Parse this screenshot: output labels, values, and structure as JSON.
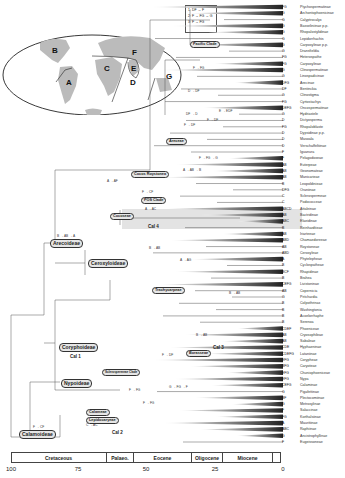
{
  "figure": {
    "legend": {
      "items": [
        "1: DF → F",
        "2: F → FG → G",
        "3: F → FG"
      ]
    },
    "map": {
      "region_labels": [
        {
          "id": "A",
          "x": 66,
          "y": 82
        },
        {
          "id": "B",
          "x": 55,
          "y": 50
        },
        {
          "id": "C",
          "x": 106,
          "y": 68
        },
        {
          "id": "D",
          "x": 131,
          "y": 82
        },
        {
          "id": "E",
          "x": 133,
          "y": 68
        },
        {
          "id": "F",
          "x": 133,
          "y": 52
        },
        {
          "id": "G",
          "x": 30,
          "y": 75
        },
        {
          "id": "G2",
          "label": "G",
          "x": 168,
          "y": 76
        }
      ]
    },
    "clades": [
      {
        "name": "Arecoideae",
        "x": 50,
        "y": 242
      },
      {
        "name": "Ceroxyloideae",
        "x": 88,
        "y": 262
      },
      {
        "name": "Coryphoideae",
        "x": 60,
        "y": 345
      },
      {
        "name": "Nypoideae",
        "x": 62,
        "y": 381
      },
      {
        "name": "Calamoideae",
        "x": 20,
        "y": 432
      }
    ],
    "small_clades": [
      {
        "name": "Pacific Clade",
        "x": 192,
        "y": 43
      },
      {
        "name": "Areceae",
        "x": 170,
        "y": 140
      },
      {
        "name": "Cocos Roystonea",
        "x": 133,
        "y": 173
      },
      {
        "name": "Euterpeae",
        "x": 158,
        "y": 157
      },
      {
        "name": "POS Clade",
        "x": 143,
        "y": 199
      },
      {
        "name": "Cocoseae",
        "x": 112,
        "y": 215
      },
      {
        "name": "Trachycarpeae",
        "x": 153,
        "y": 289
      },
      {
        "name": "Borasseae",
        "x": 186,
        "y": 352
      },
      {
        "name": "Sclerospermeae Clade",
        "x": 104,
        "y": 371
      },
      {
        "name": "Calameae",
        "x": 87,
        "y": 412
      },
      {
        "name": "Lepidocaryeae",
        "x": 87,
        "y": 419
      }
    ],
    "cal_labels": [
      {
        "name": "Cal 1",
        "x": 71,
        "y": 357
      },
      {
        "name": "Cal 2",
        "x": 113,
        "y": 432
      },
      {
        "name": "Cal 3",
        "x": 215,
        "y": 349
      },
      {
        "name": "Cal 4",
        "x": 148,
        "y": 227
      }
    ],
    "transitions": [
      {
        "text": "F → FG",
        "x": 193,
        "y": 69
      },
      {
        "text": "D → DF",
        "x": 188,
        "y": 92
      },
      {
        "text": "DF → D",
        "x": 186,
        "y": 115
      },
      {
        "text": "F → DF",
        "x": 184,
        "y": 126
      },
      {
        "text": "F → DF",
        "x": 207,
        "y": 121
      },
      {
        "text": "E → EDF",
        "x": 219,
        "y": 112
      },
      {
        "text": "F → FG → G",
        "x": 199,
        "y": 159
      },
      {
        "text": "A → AB → B",
        "x": 183,
        "y": 171
      },
      {
        "text": "A → AF",
        "x": 107,
        "y": 182
      },
      {
        "text": "F → CF",
        "x": 142,
        "y": 193
      },
      {
        "text": "A → AC",
        "x": 145,
        "y": 210
      },
      {
        "text": "B → AB → A",
        "x": 57,
        "y": 237
      },
      {
        "text": "B → AB",
        "x": 149,
        "y": 249
      },
      {
        "text": "A → AG",
        "x": 180,
        "y": 261
      },
      {
        "text": "B → AB",
        "x": 229,
        "y": 294
      },
      {
        "text": "B → AB",
        "x": 196,
        "y": 336
      },
      {
        "text": "F → DF",
        "x": 162,
        "y": 356
      },
      {
        "text": "F → FG",
        "x": 129,
        "y": 391
      },
      {
        "text": "G → FG → F",
        "x": 169,
        "y": 388
      },
      {
        "text": "F → FG",
        "x": 143,
        "y": 404
      },
      {
        "text": "C → AC",
        "x": 86,
        "y": 426
      },
      {
        "text": "F → CF",
        "x": 33,
        "y": 428
      }
    ],
    "taxa": [
      {
        "area": "FG",
        "name": "Ptychospermatinae"
      },
      {
        "area": "G",
        "name": "Archontophoenicinae"
      },
      {
        "area": "G",
        "name": "Calyptrocalyx"
      },
      {
        "area": "G",
        "name": "Basseliniinae p.p."
      },
      {
        "area": "G",
        "name": "Rhopalostylidinae"
      },
      {
        "area": "G",
        "name": "Lepidorrhachis"
      },
      {
        "area": "G",
        "name": "Carpoxylinae p.p."
      },
      {
        "area": "G",
        "name": "Dransfieldia"
      },
      {
        "area": "FG",
        "name": "Heterospathe"
      },
      {
        "area": "FG",
        "name": "Carpoxylinae"
      },
      {
        "area": "G",
        "name": "Clinospermatinae"
      },
      {
        "area": "G",
        "name": "Linospadicinae"
      },
      {
        "area": "DFG",
        "name": "Arecinae"
      },
      {
        "area": "DF",
        "name": "Bentinckia"
      },
      {
        "area": "G",
        "name": "Clinostigma"
      },
      {
        "area": "FG",
        "name": "Cyrtostachys"
      },
      {
        "area": "DEFG",
        "name": "Oncospermatinae"
      },
      {
        "area": "G",
        "name": "Hydriastele"
      },
      {
        "area": "D",
        "name": "Dictyosperma"
      },
      {
        "area": "FG",
        "name": "Rhopaloblaste"
      },
      {
        "area": "D",
        "name": "Dypsidinae p.p."
      },
      {
        "area": "D",
        "name": "Masoala"
      },
      {
        "area": "D",
        "name": "Verschaffeltiinae"
      },
      {
        "area": "F",
        "name": "Iguanura"
      },
      {
        "area": "F",
        "name": "Pelagodoxeae"
      },
      {
        "area": "AB",
        "name": "Euterpeae"
      },
      {
        "area": "AB",
        "name": "Geonomateae"
      },
      {
        "area": "AB",
        "name": "Manicarieae"
      },
      {
        "area": "B",
        "name": "Leopoldinieae"
      },
      {
        "area": "DFG",
        "name": "Oraniinae"
      },
      {
        "area": "C",
        "name": "Sclerospermeae"
      },
      {
        "area": "C",
        "name": "Podococceae"
      },
      {
        "area": "ABCD",
        "name": "Attaleinae"
      },
      {
        "area": "AB",
        "name": "Bactridinae"
      },
      {
        "area": "ABC",
        "name": "Elaeidinae"
      },
      {
        "area": "B",
        "name": "Reinhardtieae"
      },
      {
        "area": "AB",
        "name": "Iriarteeae"
      },
      {
        "area": "ABD",
        "name": "Chamaedoreeae"
      },
      {
        "area": "AB",
        "name": "Roystoneae"
      },
      {
        "area": "ABD",
        "name": "Ceroxyleae"
      },
      {
        "area": "A",
        "name": "Phytelepheae"
      },
      {
        "area": "B",
        "name": "Cyclospatheae"
      },
      {
        "area": "BCF",
        "name": "Rhapidinae"
      },
      {
        "area": "B",
        "name": "Brahea"
      },
      {
        "area": "CEFG",
        "name": "Livistoninae"
      },
      {
        "area": "AB",
        "name": "Copernicia"
      },
      {
        "area": "G",
        "name": "Pritchardia"
      },
      {
        "area": "B",
        "name": "Colpothrinax"
      },
      {
        "area": "B",
        "name": "Washingtonia"
      },
      {
        "area": "B",
        "name": "Acoelorrhaphe"
      },
      {
        "area": "B",
        "name": "Serenoa"
      },
      {
        "area": "CDEF",
        "name": "Phoeniceae"
      },
      {
        "area": "AB",
        "name": "Cryosophileae"
      },
      {
        "area": "AB",
        "name": "Sabaleae"
      },
      {
        "area": "CDE",
        "name": "Hyphaeninae"
      },
      {
        "area": "CDEFG",
        "name": "Lataniinae"
      },
      {
        "area": "EFG",
        "name": "Corypheae"
      },
      {
        "area": "BFG",
        "name": "Caryoteae"
      },
      {
        "area": "EFG",
        "name": "Chuniophoeniceae"
      },
      {
        "area": "EFG",
        "name": "Nypa"
      },
      {
        "area": "CEFG",
        "name": "Calaminae"
      },
      {
        "area": "G",
        "name": "Pigafettinae"
      },
      {
        "area": "BF",
        "name": "Plectocomiinae"
      },
      {
        "area": "G",
        "name": "Metroxylinae"
      },
      {
        "area": "F",
        "name": "Salaccinae"
      },
      {
        "area": "FG",
        "name": "Korthalsiinae"
      },
      {
        "area": "A",
        "name": "Mauritiinae"
      },
      {
        "area": "ABC",
        "name": "Raphiinae"
      },
      {
        "area": "G",
        "name": "Ancistrophyllinae"
      },
      {
        "area": "F",
        "name": "Eugeissoneae"
      }
    ],
    "timescale": {
      "epochs": [
        {
          "name": "Cretaceous",
          "x0": 11,
          "x1": 106
        },
        {
          "name": "Palaeo.",
          "x0": 106,
          "x1": 133
        },
        {
          "name": "Eocene",
          "x0": 133,
          "x1": 191
        },
        {
          "name": "Oligocene",
          "x0": 191,
          "x1": 222
        },
        {
          "name": "Miocene",
          "x0": 222,
          "x1": 272
        },
        {
          "name": "",
          "x0": 272,
          "x1": 281
        }
      ],
      "ticks": [
        {
          "label": "100",
          "x": 11
        },
        {
          "label": "75",
          "x": 78
        },
        {
          "label": "50",
          "x": 146
        },
        {
          "label": "25",
          "x": 215
        },
        {
          "label": "0",
          "x": 283
        }
      ]
    }
  }
}
